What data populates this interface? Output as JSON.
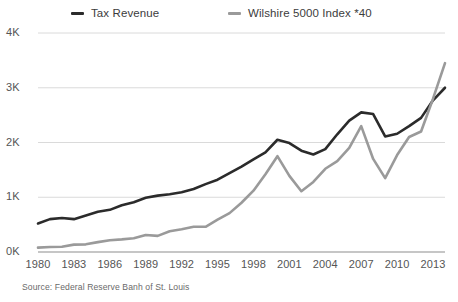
{
  "chart_data": {
    "type": "line",
    "title": "",
    "subtitle": "",
    "xlabel": "",
    "ylabel": "",
    "xlim": [
      1980,
      2014
    ],
    "ylim": [
      0,
      4000
    ],
    "grid": true,
    "legend_position": "top",
    "source": "Source: Federal Reserve Banh of St. Louis",
    "y_ticks": [
      {
        "value": 4000,
        "label": "4K"
      },
      {
        "value": 3000,
        "label": "3K"
      },
      {
        "value": 2000,
        "label": "2K"
      },
      {
        "value": 1000,
        "label": "1K"
      },
      {
        "value": 0,
        "label": "0K"
      }
    ],
    "x_ticks": [
      {
        "value": 1980,
        "label": "1980"
      },
      {
        "value": 1983,
        "label": "1983"
      },
      {
        "value": 1986,
        "label": "1986"
      },
      {
        "value": 1989,
        "label": "1989"
      },
      {
        "value": 1992,
        "label": "1992"
      },
      {
        "value": 1995,
        "label": "1995"
      },
      {
        "value": 1998,
        "label": "1998"
      },
      {
        "value": 2001,
        "label": "2001"
      },
      {
        "value": 2004,
        "label": "2004"
      },
      {
        "value": 2007,
        "label": "2007"
      },
      {
        "value": 2010,
        "label": "2010"
      },
      {
        "value": 2013,
        "label": "2013"
      }
    ],
    "x": [
      1980,
      1981,
      1982,
      1983,
      1984,
      1985,
      1986,
      1987,
      1988,
      1989,
      1990,
      1991,
      1992,
      1993,
      1994,
      1995,
      1996,
      1997,
      1998,
      1999,
      2000,
      2001,
      2002,
      2003,
      2004,
      2005,
      2006,
      2007,
      2008,
      2009,
      2010,
      2011,
      2012,
      2013,
      2014
    ],
    "series": [
      {
        "name": "Tax Revenue",
        "color": "#2b2b2b",
        "width": 2.6,
        "values": [
          520,
          600,
          620,
          600,
          665,
          735,
          770,
          855,
          910,
          990,
          1030,
          1055,
          1090,
          1150,
          1240,
          1320,
          1440,
          1560,
          1690,
          1820,
          2050,
          1990,
          1850,
          1780,
          1880,
          2150,
          2400,
          2550,
          2520,
          2110,
          2160,
          2300,
          2450,
          2770,
          3000
        ]
      },
      {
        "name": "Wilshire 5000 Index *40",
        "color": "#9a9a9a",
        "width": 2.6,
        "values": [
          80,
          90,
          95,
          135,
          140,
          180,
          215,
          230,
          250,
          310,
          295,
          380,
          415,
          460,
          460,
          590,
          710,
          900,
          1120,
          1420,
          1750,
          1390,
          1110,
          1280,
          1520,
          1660,
          1900,
          2300,
          1700,
          1350,
          1770,
          2100,
          2200,
          2800,
          3450
        ]
      }
    ]
  },
  "legend": {
    "items": [
      {
        "label": "Tax Revenue"
      },
      {
        "label": "Wilshire 5000 Index *40"
      }
    ]
  }
}
